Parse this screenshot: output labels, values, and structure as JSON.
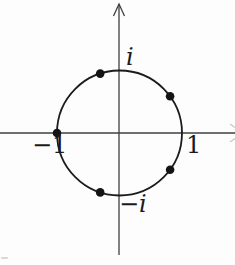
{
  "figure": {
    "type": "diagram",
    "colors": {
      "background": "#fdfdfd",
      "circle_stroke": "#1b1b1b",
      "axis_stroke": "#3f3f3f",
      "dot_fill": "#141414",
      "faint_mark": "#c6c6c2"
    },
    "circle": {
      "cx": 119.5,
      "cy": 133,
      "r": 62.5,
      "stroke_width": 1.8
    },
    "axes": {
      "x_axis": {
        "y": 133,
        "x1": 0,
        "x2": 235,
        "stroke_width": 1.3
      },
      "y_axis": {
        "x": 119,
        "y1": 4,
        "y2": 255,
        "stroke_width": 1.3
      },
      "y_arrowhead": {
        "tip_x": 119,
        "tip_y": 4,
        "half_width": 5.5,
        "length": 12
      },
      "x_arrowhead_partial_marks": [
        {
          "x1": 230,
          "y1": 124,
          "x2": 235,
          "y2": 127.5
        },
        {
          "x1": 230,
          "y1": 142,
          "x2": 235,
          "y2": 138.5
        }
      ]
    },
    "points": {
      "dot_radius": 4.3,
      "angles_deg": [
        36,
        108,
        180,
        252,
        324
      ]
    },
    "labels": [
      {
        "text": "i",
        "left": 126,
        "top": 45,
        "italic": true
      },
      {
        "text": "−i",
        "left": 119,
        "top": 192,
        "italic": true
      },
      {
        "text": "1",
        "left": 186,
        "top": 133,
        "italic": false
      },
      {
        "text": "−1",
        "left": 32,
        "top": 133,
        "italic": false
      }
    ]
  }
}
